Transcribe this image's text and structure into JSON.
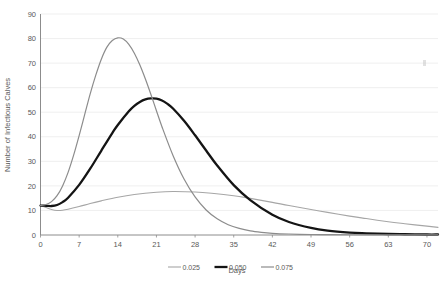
{
  "chart_data": {
    "type": "line",
    "title": "",
    "xlabel": "Days",
    "ylabel": "Number of Infectious Calves",
    "xlim": [
      0,
      72
    ],
    "ylim": [
      0,
      90
    ],
    "xticks": [
      0,
      7,
      14,
      21,
      28,
      35,
      42,
      49,
      56,
      63,
      70
    ],
    "yticks": [
      0,
      10,
      20,
      30,
      40,
      50,
      60,
      70,
      80,
      90
    ],
    "grid": true,
    "legend_position": "bottom",
    "series": [
      {
        "name": "0.025",
        "color": "#a6a6a6",
        "width": 1.1,
        "x": [
          0,
          1,
          2,
          3,
          4,
          5,
          7,
          9,
          11,
          14,
          17,
          21,
          24,
          28,
          31,
          35,
          38,
          42,
          45,
          49,
          52,
          56,
          59,
          63,
          66,
          70,
          72
        ],
        "values": [
          12,
          11.2,
          10.4,
          10.0,
          10.1,
          10.5,
          11.6,
          12.8,
          13.9,
          15.4,
          16.5,
          17.4,
          17.7,
          17.5,
          17.0,
          16.0,
          14.9,
          13.3,
          12.0,
          10.4,
          9.2,
          7.7,
          6.7,
          5.4,
          4.6,
          3.6,
          3.1
        ]
      },
      {
        "name": "0.050",
        "color": "#141414",
        "width": 2.3,
        "x": [
          0,
          1,
          2,
          3,
          4,
          5,
          7,
          9,
          11,
          13,
          14,
          16,
          17,
          18,
          19,
          20,
          21,
          22,
          23,
          24,
          26,
          28,
          30,
          32,
          35,
          38,
          42,
          45,
          49,
          52,
          56,
          59,
          63,
          66,
          70,
          72
        ],
        "values": [
          12,
          11.9,
          11.8,
          12.2,
          13.4,
          15.2,
          20.4,
          27.0,
          34.3,
          41.5,
          44.8,
          50.4,
          52.6,
          54.2,
          55.2,
          55.6,
          55.5,
          54.8,
          53.4,
          51.5,
          46.5,
          40.6,
          34.4,
          28.3,
          20.3,
          14.2,
          8.2,
          5.3,
          2.9,
          1.8,
          1.0,
          0.7,
          0.4,
          0.3,
          0.2,
          0.2
        ]
      },
      {
        "name": "0.075",
        "color": "#8c8c8c",
        "width": 1.2,
        "x": [
          0,
          1,
          2,
          3,
          4,
          5,
          6,
          7,
          8,
          9,
          10,
          11,
          12,
          13,
          14,
          15,
          16,
          17,
          18,
          19,
          20,
          21,
          22,
          24,
          26,
          28,
          30,
          32,
          34,
          36,
          38,
          40,
          42,
          45,
          49,
          52,
          56,
          63,
          70,
          72
        ],
        "values": [
          12,
          12.4,
          13.6,
          16.0,
          20.0,
          25.5,
          32.5,
          40.5,
          49.0,
          57.5,
          65.0,
          71.5,
          76.4,
          79.2,
          80.3,
          79.8,
          77.6,
          74.0,
          69.2,
          63.5,
          57.2,
          50.6,
          44.1,
          32.4,
          22.8,
          15.5,
          10.2,
          6.6,
          4.2,
          2.7,
          1.7,
          1.1,
          0.7,
          0.4,
          0.2,
          0.15,
          0.1,
          0.05,
          0.03,
          0.02
        ]
      }
    ]
  },
  "legend": {
    "items": [
      {
        "label": "0.025"
      },
      {
        "label": "0.050"
      },
      {
        "label": "0.075"
      }
    ]
  },
  "axis": {
    "x_title": "Days",
    "y_title": "Number of Infectious Calves"
  }
}
